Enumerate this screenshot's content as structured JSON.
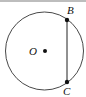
{
  "diagram": {
    "type": "circle-chord",
    "circle": {
      "cx": 44.5,
      "cy": 51,
      "r": 39
    },
    "center": {
      "label": "O",
      "x": 45,
      "y": 51
    },
    "points": [
      {
        "label": "B",
        "x": 67,
        "y": 20
      },
      {
        "label": "C",
        "x": 67,
        "y": 82
      }
    ],
    "segments": [
      {
        "from": "B",
        "to": "C"
      }
    ],
    "colors": {
      "stroke": "#222222",
      "border": "#bdbdbd"
    }
  }
}
